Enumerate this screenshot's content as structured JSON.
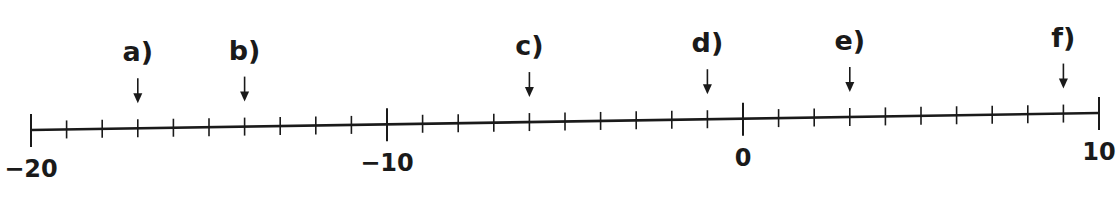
{
  "number_line": {
    "min": -20,
    "max": 10,
    "tick_step": 1,
    "labeled_ticks": [
      {
        "value": -20,
        "label": "−20"
      },
      {
        "value": -10,
        "label": "−10"
      },
      {
        "value": 0,
        "label": "0"
      },
      {
        "value": 10,
        "label": "10"
      }
    ],
    "line_color": "#1a1a1a"
  },
  "arrows": [
    {
      "label": "a)",
      "value": -17
    },
    {
      "label": "b)",
      "value": -14
    },
    {
      "label": "c)",
      "value": -6
    },
    {
      "label": "d)",
      "value": -1
    },
    {
      "label": "e)",
      "value": 3
    },
    {
      "label": "f)",
      "value": 9
    }
  ]
}
